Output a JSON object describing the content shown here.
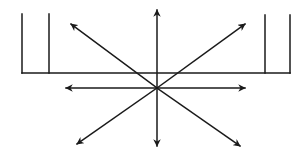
{
  "diagram": {
    "title": "Radial arrows from a central point below a bracketed baseline",
    "stroke_color": "#1a1a1a",
    "background": "#ffffff",
    "center": {
      "x": 157,
      "y": 88
    },
    "baseline": {
      "x1": 22,
      "y1": 73,
      "x2": 290,
      "y2": 73
    },
    "brackets": [
      {
        "name": "left-outer-post",
        "x": 22,
        "y_top": 14,
        "y_bottom": 73
      },
      {
        "name": "left-inner-post",
        "x": 49,
        "y_top": 14,
        "y_bottom": 73
      },
      {
        "name": "right-inner-post",
        "x": 265,
        "y_top": 15,
        "y_bottom": 73
      },
      {
        "name": "right-outer-post",
        "x": 290,
        "y_top": 15,
        "y_bottom": 73
      }
    ],
    "arrows": [
      {
        "name": "arrow-up",
        "x": 157,
        "y": 10
      },
      {
        "name": "arrow-down",
        "x": 157,
        "y": 146
      },
      {
        "name": "arrow-left",
        "x": 66,
        "y": 88
      },
      {
        "name": "arrow-right",
        "x": 245,
        "y": 88
      },
      {
        "name": "arrow-up-left",
        "x": 71,
        "y": 24
      },
      {
        "name": "arrow-up-right",
        "x": 245,
        "y": 24
      },
      {
        "name": "arrow-down-left",
        "x": 77,
        "y": 144
      },
      {
        "name": "arrow-down-right",
        "x": 240,
        "y": 146
      }
    ]
  }
}
